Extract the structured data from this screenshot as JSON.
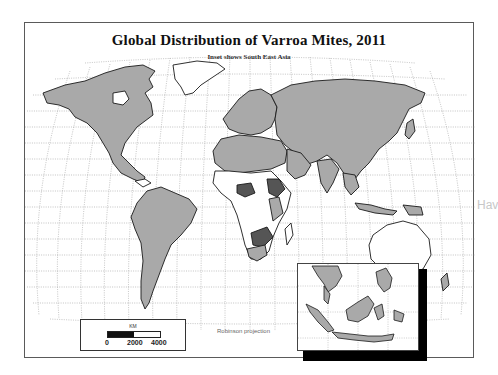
{
  "map": {
    "title": "Global Distribution of Varroa Mites, 2011",
    "subtitle": "Inset shows South East Asia",
    "projection_label": "Robinson projection",
    "watermark_text": "Hav",
    "colors": {
      "present": "#a9a9a9",
      "high": "#555555",
      "absent": "#ffffff",
      "border": "#1a1a1a",
      "grid": "#9a9a9a",
      "frame": "#5a5a5a"
    },
    "legend": {
      "categories": [
        {
          "name": "Varroa present",
          "color": "#a9a9a9"
        },
        {
          "name": "Varroa widespread / dense",
          "color": "#555555"
        },
        {
          "name": "No record",
          "color": "#ffffff"
        }
      ]
    },
    "scale_bar": {
      "unit": "KM",
      "ticks": [
        "0",
        "2000",
        "4000"
      ]
    },
    "inset": {
      "region": "South East Asia"
    }
  }
}
